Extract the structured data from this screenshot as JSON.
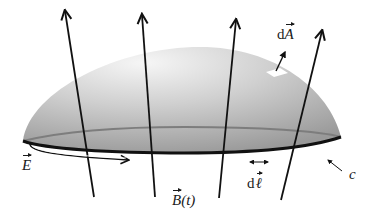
{
  "figure": {
    "colors": {
      "dome_light": "#f4f4f4",
      "dome_dark": "#9a9a9a",
      "rim_back": "#7a7a7a",
      "rim_front": "#111111",
      "field_lines": "#111111",
      "area_patch": "#ffffff"
    },
    "labels": {
      "dA": {
        "prefix": "d",
        "symbol": "A"
      },
      "E": {
        "symbol": "E"
      },
      "B": {
        "symbol": "B",
        "suffix": "(t)"
      },
      "dl": {
        "prefix": "d",
        "symbol": "ℓ"
      },
      "c": {
        "text": "c"
      }
    },
    "field_lines": [
      {
        "name": "B-line-1",
        "x1": 94,
        "y1": 197,
        "x2": 65,
        "y2": 10
      },
      {
        "name": "B-line-2",
        "x1": 155,
        "y1": 197,
        "x2": 141,
        "y2": 14
      },
      {
        "name": "B-line-3",
        "x1": 219,
        "y1": 198,
        "x2": 236,
        "y2": 19
      },
      {
        "name": "B-line-4",
        "x1": 281,
        "y1": 200,
        "x2": 322,
        "y2": 30
      }
    ],
    "elements": {
      "E_arrow": "circulation arrow along front rim pointing right",
      "dl_arrow": "double-headed arrow segment along rim",
      "dA_arrow": "normal vector from surface patch",
      "c_pointer": "arrow pointing to boundary curve"
    }
  }
}
